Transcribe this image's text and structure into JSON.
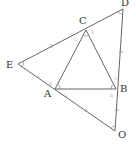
{
  "diagram": {
    "type": "geometry",
    "points": {
      "A": {
        "label": "A",
        "x": 55,
        "y": 89,
        "lx": 44,
        "ly": 97
      },
      "B": {
        "label": "B",
        "x": 116,
        "y": 89,
        "lx": 120,
        "ly": 92
      },
      "C": {
        "label": "C",
        "x": 86,
        "y": 30,
        "lx": 79,
        "ly": 24
      },
      "D": {
        "label": "D",
        "x": 123,
        "y": 9,
        "lx": 121,
        "ly": 6
      },
      "E": {
        "label": "E",
        "x": 18,
        "y": 64,
        "lx": 6,
        "ly": 68
      },
      "O": {
        "label": "O",
        "x": 115,
        "y": 131,
        "lx": 118,
        "ly": 138
      }
    },
    "segments": [
      [
        "E",
        "D"
      ],
      [
        "D",
        "O"
      ],
      [
        "O",
        "E"
      ],
      [
        "A",
        "B"
      ],
      [
        "B",
        "C"
      ],
      [
        "C",
        "A"
      ]
    ],
    "angle_marks": [
      "E",
      "D",
      "O",
      "A",
      "B",
      "C"
    ],
    "symbols": {
      "circle": "○",
      "triangle": "△"
    }
  }
}
